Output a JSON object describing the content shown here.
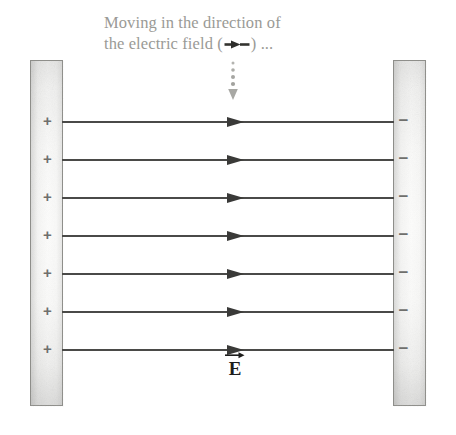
{
  "figure": {
    "name": "parallel-plate-capacitor-electric-field-diagram",
    "background_color": "#ffffff",
    "caption": {
      "line1": "Moving in the direction of",
      "line2_before": "the electric field (",
      "line2_after": ") ...",
      "inline_icon": "right-arrow-icon",
      "color": "#9a9a96"
    },
    "pointer": {
      "icon": "dotted-down-arrow-icon",
      "color": "#a8a8a4",
      "dots": 4
    },
    "plates": {
      "left": {
        "label": "positive-plate",
        "charge_symbol": "+",
        "charge_count": 7,
        "border_color": "#8e8e8a",
        "symbol_color": "#6f6f6c"
      },
      "right": {
        "label": "negative-plate",
        "charge_symbol": "−",
        "charge_count": 7,
        "border_color": "#8e8e8a",
        "symbol_color": "#6f6f6c"
      }
    },
    "field": {
      "line_count": 7,
      "line_color": "#4a4a48",
      "arrow_color": "#3a3a38",
      "direction": "left-to-right",
      "label_glyph": "E",
      "label_accent": "vector-arrow",
      "label_color": "#1d1d1c"
    },
    "geometry": {
      "line_y_positions": [
        121,
        159,
        197,
        235,
        273,
        311,
        349
      ],
      "charge_y_positions": [
        121,
        159,
        197,
        235,
        273,
        311,
        349
      ],
      "plate_top": 60,
      "plate_height": 346,
      "left_plate_x": 30,
      "right_plate_x": 393,
      "plate_width": 33,
      "line_left": 62,
      "line_width": 332,
      "arrowhead_x": 227
    }
  }
}
